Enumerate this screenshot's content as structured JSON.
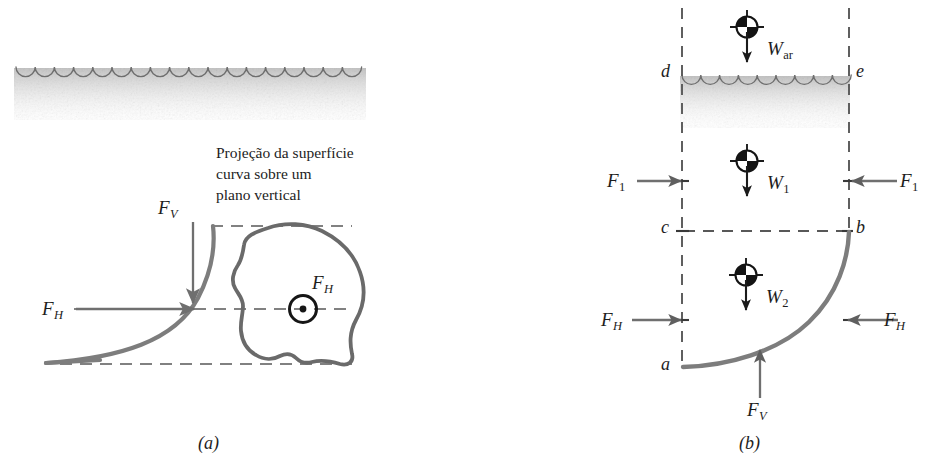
{
  "figure": {
    "panels": [
      {
        "id": "a",
        "caption": "(a)",
        "annotation_note": "Projeção da superfície\ncurva sobre um\nplano vertical",
        "labels": [
          {
            "name": "fv",
            "symbol": "F",
            "sub": "V"
          },
          {
            "name": "fh-curve",
            "symbol": "F",
            "sub": "H"
          },
          {
            "name": "fh-projection",
            "symbol": "F",
            "sub": "H"
          }
        ],
        "elements": [
          "water-surface-waves",
          "curved-surface",
          "projection-outline",
          "centroid-dot-marker",
          "dashed-reference-lines"
        ]
      },
      {
        "id": "b",
        "caption": "(b)",
        "vertices": [
          "a",
          "b",
          "c",
          "d",
          "e"
        ],
        "labels": [
          {
            "name": "w-ar",
            "symbol": "W",
            "sub": "ar",
            "sub_upright": true
          },
          {
            "name": "w1",
            "symbol": "W",
            "sub": "1",
            "sub_upright": true
          },
          {
            "name": "w2",
            "symbol": "W",
            "sub": "2",
            "sub_upright": true
          },
          {
            "name": "f1-left",
            "symbol": "F",
            "sub": "1",
            "sub_upright": true
          },
          {
            "name": "f1-right",
            "symbol": "F",
            "sub": "1",
            "sub_upright": true
          },
          {
            "name": "fh-left",
            "symbol": "F",
            "sub": "H"
          },
          {
            "name": "fh-right",
            "symbol": "F",
            "sub": "H"
          },
          {
            "name": "fv-bottom",
            "symbol": "F",
            "sub": "V"
          }
        ],
        "elements": [
          "water-surface-waves",
          "free-body-boundary-dashed",
          "curved-surface-arc",
          "centroid-markers",
          "force-arrows"
        ]
      }
    ],
    "colors": {
      "curve": "#7d7d7d",
      "arrow": "#6f6f6f",
      "dashed": "#585858",
      "wave_line": "#6e6e6e",
      "water_fill": "#c9c9c9",
      "text": "#1d1d1d",
      "centroid_dark": "#141414",
      "background": "#ffffff"
    }
  }
}
